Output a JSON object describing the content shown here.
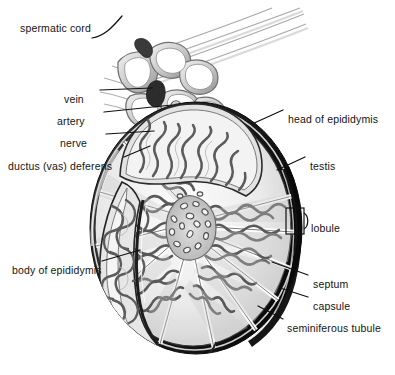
{
  "figure": {
    "background_color": "#ffffff",
    "ink_color": "#141414",
    "capsule_color": "#1a1a1a",
    "tissue_light": "#e8e8e8",
    "tissue_mid": "#b9b9b9",
    "tissue_dark": "#7d7d7d"
  },
  "labels": {
    "spermatic_cord": "spermatic cord",
    "vein": "vein",
    "artery": "artery",
    "nerve": "nerve",
    "ductus_vas_deferens": "ductus (vas) deferens",
    "body_of_epididymis": "body of epididymis",
    "head_of_epididymis": "head of epididymis",
    "testis": "testis",
    "lobule": "lobule",
    "septum": "septum",
    "capsule": "capsule",
    "seminiferous_tubule": "seminiferous tubule"
  },
  "label_layout": {
    "left_column": [
      {
        "key": "spermatic_cord",
        "x": 20,
        "y": 22,
        "align": "left"
      },
      {
        "key": "vein",
        "x": 64,
        "y": 93,
        "align": "left"
      },
      {
        "key": "artery",
        "x": 57,
        "y": 115,
        "align": "left"
      },
      {
        "key": "nerve",
        "x": 60,
        "y": 137,
        "align": "left"
      },
      {
        "key": "ductus_vas_deferens",
        "x": 8,
        "y": 160,
        "align": "left"
      },
      {
        "key": "body_of_epididymis",
        "x": 12,
        "y": 264,
        "align": "left"
      }
    ],
    "right_column": [
      {
        "key": "head_of_epididymis",
        "x": 288,
        "y": 113,
        "align": "left"
      },
      {
        "key": "testis",
        "x": 310,
        "y": 160,
        "align": "left"
      },
      {
        "key": "lobule",
        "x": 311,
        "y": 222,
        "align": "left"
      },
      {
        "key": "septum",
        "x": 313,
        "y": 278,
        "align": "left"
      },
      {
        "key": "capsule",
        "x": 313,
        "y": 300,
        "align": "left"
      },
      {
        "key": "seminiferous_tubule",
        "x": 287,
        "y": 322,
        "align": "left"
      }
    ]
  },
  "structures": {
    "lobule_count": 11,
    "cord_vessel_loops": 6,
    "mediastinum_duct_count": 16
  }
}
